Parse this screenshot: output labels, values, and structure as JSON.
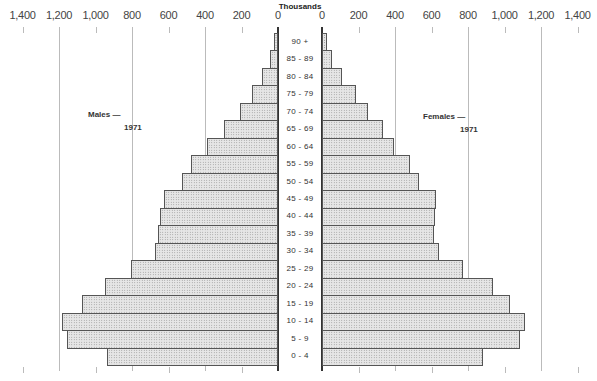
{
  "chart_data": {
    "type": "bar",
    "orientation": "horizontal",
    "subtype": "population-pyramid",
    "title": "",
    "units_label": "Thousands",
    "categories": [
      "90 +",
      "85 - 89",
      "80 - 84",
      "75 - 79",
      "70 - 74",
      "65 - 69",
      "60 - 64",
      "55 - 59",
      "50 - 54",
      "45 - 49",
      "40 - 44",
      "35 - 39",
      "30 - 34",
      "25 - 29",
      "20 - 24",
      "15 - 19",
      "10 - 14",
      "5 - 9",
      "0 - 4"
    ],
    "series": [
      {
        "name": "Males — 1971",
        "side": "left",
        "values": [
          20,
          45,
          90,
          145,
          210,
          295,
          390,
          475,
          525,
          625,
          645,
          660,
          675,
          805,
          950,
          1075,
          1185,
          1155,
          935
        ]
      },
      {
        "name": "Females — 1971",
        "side": "right",
        "values": [
          25,
          55,
          110,
          185,
          250,
          335,
          395,
          480,
          530,
          625,
          620,
          615,
          640,
          770,
          935,
          1030,
          1115,
          1085,
          880
        ]
      }
    ],
    "xlim": [
      0,
      1400
    ],
    "left_ticks": [
      "1,400",
      "1,200",
      "1,000",
      "800",
      "600",
      "400",
      "200",
      "0"
    ],
    "right_ticks": [
      "0",
      "200",
      "400",
      "600",
      "800",
      "1,000",
      "1,200",
      "1,400"
    ],
    "tick_values": [
      0,
      200,
      400,
      600,
      800,
      1000,
      1200,
      1400
    ],
    "gridlines_at": [
      400,
      800,
      1200
    ],
    "legend_position": "inline-labels"
  },
  "labels": {
    "units": "Thousands",
    "males_line1": "Males —",
    "males_line2": "1971",
    "females_line1": "Females —",
    "females_line2": "1971"
  },
  "colors": {
    "bar_fill": "#e6e6e6",
    "bar_dots": "#8a8a8a",
    "bar_border": "#555555",
    "gridline": "#bbbbbb",
    "axis": "#333333"
  }
}
